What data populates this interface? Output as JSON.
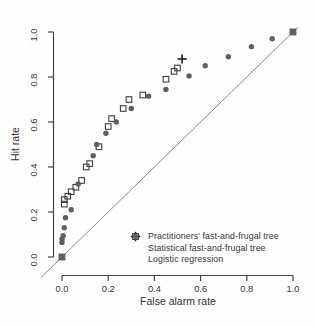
{
  "chart_data": {
    "type": "scatter",
    "title": "",
    "xlabel": "False alarm rate",
    "ylabel": "Hit rate",
    "xlim": [
      0,
      1
    ],
    "ylim": [
      0,
      1
    ],
    "x_ticks": [
      "0.0",
      "0.2",
      "0.4",
      "0.6",
      "0.8",
      "1.0"
    ],
    "y_ticks": [
      "0.0",
      "0.2",
      "0.4",
      "0.6",
      "0.8",
      "1.0"
    ],
    "grid": false,
    "diagonal_reference_line": true,
    "legend_position": "inside-bottom-right",
    "series": [
      {
        "name": "Practitioners' fast-and-frugal tree",
        "marker": "plus",
        "color": "#1a1a1a",
        "points": [
          [
            0.52,
            0.88
          ]
        ]
      },
      {
        "name": "Statistical fast-and-frugal tree",
        "marker": "open-square",
        "color": "#3f3f3f",
        "points": [
          [
            0.0,
            0.0
          ],
          [
            0.01,
            0.235
          ],
          [
            0.01,
            0.255
          ],
          [
            0.025,
            0.27
          ],
          [
            0.04,
            0.29
          ],
          [
            0.06,
            0.31
          ],
          [
            0.085,
            0.34
          ],
          [
            0.105,
            0.4
          ],
          [
            0.12,
            0.415
          ],
          [
            0.16,
            0.49
          ],
          [
            0.2,
            0.58
          ],
          [
            0.215,
            0.615
          ],
          [
            0.265,
            0.66
          ],
          [
            0.29,
            0.7
          ],
          [
            0.35,
            0.72
          ],
          [
            0.45,
            0.79
          ],
          [
            0.485,
            0.825
          ],
          [
            0.5,
            0.84
          ],
          [
            1.0,
            1.0
          ]
        ]
      },
      {
        "name": "Logistic regression",
        "marker": "filled-circle",
        "color": "#5f5f5f",
        "points": [
          [
            0.0,
            0.0
          ],
          [
            0.0,
            0.065
          ],
          [
            0.0,
            0.08
          ],
          [
            0.005,
            0.095
          ],
          [
            0.01,
            0.13
          ],
          [
            0.015,
            0.175
          ],
          [
            0.04,
            0.21
          ],
          [
            0.07,
            0.325
          ],
          [
            0.135,
            0.45
          ],
          [
            0.15,
            0.5
          ],
          [
            0.19,
            0.55
          ],
          [
            0.235,
            0.6
          ],
          [
            0.3,
            0.66
          ],
          [
            0.375,
            0.715
          ],
          [
            0.45,
            0.745
          ],
          [
            0.55,
            0.805
          ],
          [
            0.62,
            0.85
          ],
          [
            0.72,
            0.89
          ],
          [
            0.82,
            0.935
          ],
          [
            0.91,
            0.97
          ],
          [
            1.0,
            1.0
          ]
        ]
      }
    ],
    "colors": {
      "axis": "#444444",
      "tick_text": "#333333",
      "diagonal": "#8c8c8c",
      "background": "#fefefe"
    }
  }
}
